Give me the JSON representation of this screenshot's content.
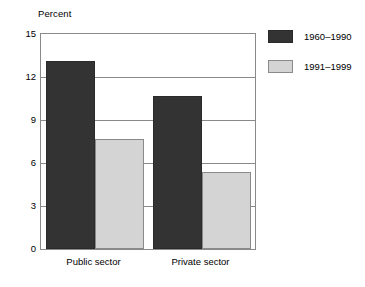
{
  "chart_data": {
    "type": "bar",
    "title": "",
    "subtitle": "",
    "xlabel": "",
    "ylabel": "Percent",
    "ylim": [
      0,
      15
    ],
    "yticks": [
      15,
      12,
      9,
      6,
      3,
      0
    ],
    "grid": true,
    "legend_position": "right",
    "categories": [
      "Public sector",
      "Private sector"
    ],
    "series": [
      {
        "name": "1960–1990",
        "color": "#333333",
        "values": [
          13.1,
          10.65
        ]
      },
      {
        "name": "1991–1999",
        "color": "#d4d4d4",
        "values": [
          7.65,
          5.4
        ]
      }
    ]
  },
  "colors": {
    "background": "#ffffff",
    "axis": "#8a8a8a",
    "gridline": "#8a8a8a",
    "text": "#000000",
    "series_dark": "#333333",
    "series_light": "#d4d4d4"
  }
}
